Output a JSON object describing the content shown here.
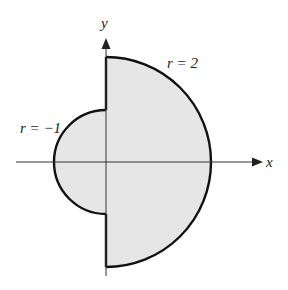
{
  "diagram": {
    "axes": {
      "x_label": "x",
      "y_label": "y"
    },
    "curves": [
      {
        "name": "outer-semicircle",
        "label": "r = 2",
        "radius": 2,
        "side": "right half-plane"
      },
      {
        "name": "inner-semicircle",
        "label": "r = −1",
        "radius": 1,
        "side": "left half-plane"
      }
    ],
    "region": {
      "fill": "#e6e6e6",
      "stroke": "#111111"
    }
  }
}
